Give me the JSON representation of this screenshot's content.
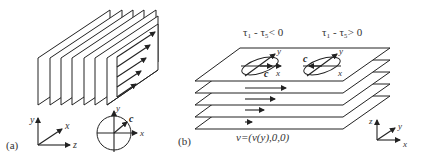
{
  "panel_a": {
    "label": "(a)",
    "axes": {
      "y": "y",
      "x": "x",
      "z": "z"
    },
    "circle_axes": {
      "y": "y",
      "x": "x",
      "vector": "c"
    },
    "plate_count": 7
  },
  "panel_b": {
    "label": "(b)",
    "condition_left": "τ₁ - τ₅< 0",
    "condition_right": "τ₁ - τ₅> 0",
    "ellipse_left": {
      "vector": "c",
      "x": "x",
      "y": "y"
    },
    "ellipse_right": {
      "vector": "c",
      "x": "x",
      "y": "y"
    },
    "velocity_label": "v=(v(y),0,0)",
    "axes": {
      "z": "z",
      "y": "y",
      "x": "x"
    },
    "plate_count": 5
  },
  "colors": {
    "stroke": "#222222",
    "background": "#ffffff",
    "text": "#333333"
  }
}
